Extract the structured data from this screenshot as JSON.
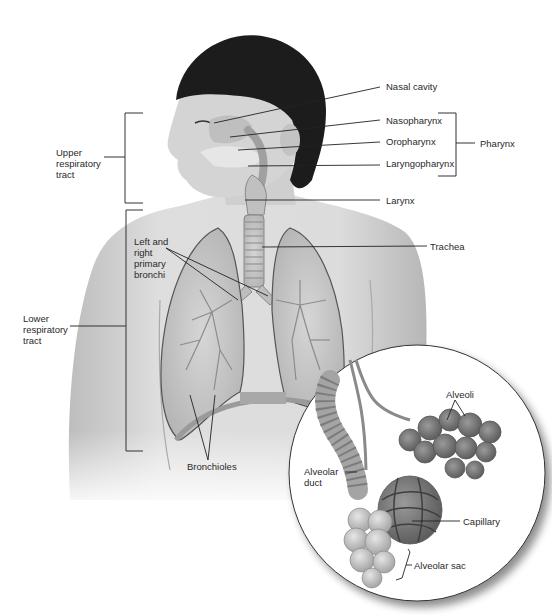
{
  "figure": {
    "colors": {
      "background": "#ffffff",
      "skin": "#d9d9d9",
      "skin_shadow": "#a8a8a8",
      "hair": "#1c1c1c",
      "lung": "#c8c8c8",
      "lung_outline": "#555555",
      "trachea": "#bcbcbc",
      "leader_line": "#222222",
      "text": "#2a2a2a",
      "inset_bg": "#ffffff",
      "inset_outline": "#333333",
      "alveoli": "#8a8a8a",
      "sac": "#c4c4c4"
    }
  },
  "brackets": {
    "upper": {
      "label": "Upper\nrespiratory\ntract"
    },
    "lower": {
      "label": "Lower\nrespiratory\ntract"
    },
    "pharynx": {
      "label": "Pharynx"
    }
  },
  "labels": {
    "nasal_cavity": "Nasal cavity",
    "nasopharynx": "Nasopharynx",
    "oropharynx": "Oropharynx",
    "laryngopharynx": "Laryngopharynx",
    "larynx": "Larynx",
    "trachea": "Trachea",
    "primary_bronchi": "Left and\nright\nprimary\nbronchi",
    "bronchioles": "Bronchioles"
  },
  "inset": {
    "alveoli": "Alveoli",
    "alveolar_duct": "Alveolar\nduct",
    "capillary": "Capillary",
    "alveolar_sac": "Alveolar sac"
  }
}
